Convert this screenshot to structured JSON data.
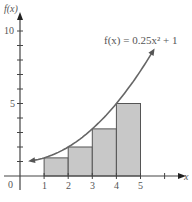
{
  "chart_data": {
    "type": "bar",
    "title": "",
    "subtitle": "",
    "xlabel": "x",
    "ylabel": "f(x)",
    "function_label": "f(x) = 0.25x² + 1",
    "function": {
      "a": 0.25,
      "b": 0,
      "c": 1
    },
    "curve_domain": [
      0.5,
      5.5
    ],
    "categories": [
      "1-2",
      "2-3",
      "3-4",
      "4-5"
    ],
    "bars": [
      {
        "x0": 1,
        "x1": 2,
        "height": 1.25
      },
      {
        "x0": 2,
        "x1": 3,
        "height": 2.0
      },
      {
        "x0": 3,
        "x1": 4,
        "height": 3.25
      },
      {
        "x0": 4,
        "x1": 5,
        "height": 5.0
      }
    ],
    "values": [
      1.25,
      2.0,
      3.25,
      5.0
    ],
    "xlim": [
      0,
      6.5
    ],
    "ylim": [
      0,
      11
    ],
    "x_ticks": [
      1,
      2,
      3,
      4,
      5,
      6
    ],
    "x_tick_labels": [
      "1",
      "2",
      "3",
      "4",
      "5"
    ],
    "y_ticks": [
      1,
      2,
      3,
      4,
      5,
      6,
      7,
      8,
      9,
      10
    ],
    "y_tick_labels": [
      "5",
      "10"
    ],
    "origin_label": "0",
    "grid": false,
    "legend": "none",
    "colors": {
      "bar_fill": "#c8c8c8",
      "bar_edge": "#555555",
      "curve": "#666666",
      "axis": "#444444"
    }
  },
  "labels": {
    "y_axis": "f(x)",
    "x_axis": "x",
    "origin": "0",
    "y5": "5",
    "y10": "10",
    "x1": "1",
    "x2": "2",
    "x3": "3",
    "x4": "4",
    "x5": "5",
    "function": "f(x) = 0.25x² + 1"
  }
}
